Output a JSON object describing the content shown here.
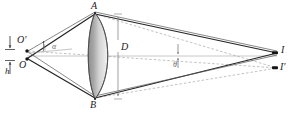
{
  "figure": {
    "kind": "optics-ray-diagram",
    "background_color": "#ffffff",
    "ink_color": "#1a1a1a",
    "gray_ray_color": "#8a8a8a",
    "lens_fill_color": "#9e9e9e",
    "lens_edge_color": "#4a4a4a"
  },
  "labels": {
    "lens_top": "A",
    "lens_bottom": "B",
    "lens_diameter": "D",
    "object_upper": "O'",
    "object_lower": "O",
    "object_height": "h",
    "image_upper": "I",
    "image_lower": "I'",
    "angle_alpha": "α",
    "angle_theta": "θ"
  },
  "points": {
    "A": {
      "x": 95,
      "y": 13,
      "label_x": 91,
      "label_y": 2
    },
    "B": {
      "x": 95,
      "y": 99,
      "label_x": 91,
      "label_y": 101
    },
    "O_prime": {
      "x": 27,
      "y": 51,
      "label_x": 18,
      "label_y": 36
    },
    "O": {
      "x": 27,
      "y": 59,
      "label_x": 20,
      "label_y": 61
    },
    "I": {
      "x": 277,
      "y": 53,
      "label_x": 281,
      "label_y": 46
    },
    "I_prime": {
      "x": 277,
      "y": 68,
      "label_x": 280,
      "label_y": 63
    }
  },
  "annotations": {
    "diameter_line_x": 118,
    "diameter_label_x": 121,
    "diameter_label_y": 43,
    "height_arrow_x": 10,
    "height_label_x": 6,
    "height_label_y": 68,
    "alpha_label_x": 52,
    "alpha_label_y": 44,
    "theta_label_x": 173,
    "theta_label_y": 62,
    "theta_marker_x": 178
  }
}
